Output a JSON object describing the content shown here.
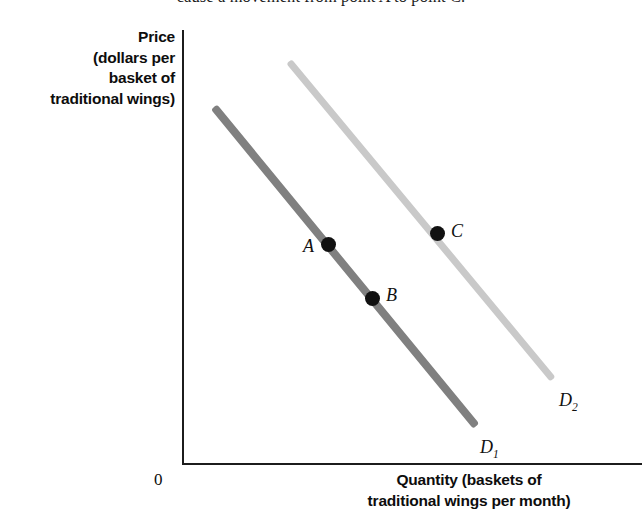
{
  "caption": {
    "text": "cause a movement from point A to point C."
  },
  "axes": {
    "y_title": "Price\n(dollars per\nbasket of\ntraditional wings)",
    "y_title_lines": [
      "Price",
      "(dollars per",
      "basket of",
      "traditional wings)"
    ],
    "x_title_lines": [
      "Quantity (baskets of",
      "traditional wings per month)"
    ],
    "origin_label": "0"
  },
  "labels": {
    "point_a": "A",
    "point_b": "B",
    "point_c": "C",
    "curve_d1": "D",
    "curve_d1_sub": "1",
    "curve_d2": "D",
    "curve_d2_sub": "2"
  },
  "colors": {
    "curve_d1": "#808080",
    "curve_d2": "#c9c9c9",
    "point": "#111111",
    "axis": "#1c1c1c",
    "text": "#0d0d0d",
    "background": "#ffffff"
  },
  "chart_data": {
    "type": "line",
    "title": "",
    "xlabel": "Quantity (baskets of traditional wings per month)",
    "ylabel": "Price (dollars per basket of traditional wings)",
    "grid": false,
    "legend": "inline-curve-labels",
    "axis_origin_px": [
      182,
      464
    ],
    "series": [
      {
        "name": "D1",
        "label": "D₁",
        "color": "#808080",
        "line_px": {
          "x1": 214,
          "y1": 107,
          "x2": 476,
          "y2": 426
        },
        "label_px": [
          480,
          437
        ],
        "description": "Original demand curve, downward sloping"
      },
      {
        "name": "D2",
        "label": "D₂",
        "color": "#c9c9c9",
        "line_px": {
          "x1": 289,
          "y1": 61,
          "x2": 553,
          "y2": 379
        },
        "label_px": [
          559,
          390
        ],
        "description": "New demand curve shifted right of D1, parallel"
      }
    ],
    "points": [
      {
        "label": "A",
        "curve": "D1",
        "px": [
          328,
          244
        ],
        "label_px": [
          303,
          236
        ],
        "label_side": "left"
      },
      {
        "label": "B",
        "curve": "D1",
        "px": [
          372,
          298
        ],
        "label_px": [
          386,
          285
        ],
        "label_side": "right"
      },
      {
        "label": "C",
        "curve": "D2",
        "px": [
          437,
          233
        ],
        "label_px": [
          451,
          221
        ],
        "label_side": "right"
      }
    ],
    "annotations": [
      "A and B lie on demand curve D1 (a movement along the curve)",
      "C lies on demand curve D2 (a shift of the curve)"
    ]
  }
}
